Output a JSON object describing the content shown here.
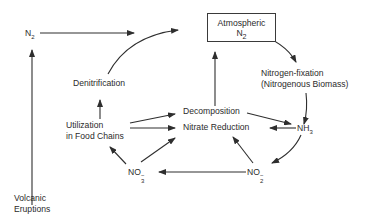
{
  "diagram": {
    "nodes": {
      "n2_source": {
        "label": "N",
        "sub": "2"
      },
      "atmospheric_n2": {
        "line1": "Atmospheric",
        "line2_base": "N",
        "line2_sub": "2"
      },
      "nitrogen_fixation": {
        "line1": "Nitrogen-fixation",
        "line2": "(Nitrogenous Biomass)"
      },
      "denitrification": {
        "label": "Denitrification"
      },
      "decomposition": {
        "label": "Decomposition"
      },
      "nitrate_reduction": {
        "label": "Nitrate Reduction"
      },
      "utilization": {
        "line1": "Utilization",
        "line2": "in Food Chains"
      },
      "nh3": {
        "base": "NH",
        "sub": "3"
      },
      "no3": {
        "base": "NO",
        "charge": "−",
        "sub": "3"
      },
      "no2": {
        "base": "NO",
        "charge": "−",
        "sub": "2"
      },
      "volcanic": {
        "line1": "Volcanic",
        "line2": "Eruptions"
      }
    },
    "edges": [
      {
        "from": "Volcanic Eruptions",
        "to": "N2"
      },
      {
        "from": "N2",
        "to": "Atmospheric N2"
      },
      {
        "from": "Denitrification",
        "to": "Atmospheric N2"
      },
      {
        "from": "Atmospheric N2",
        "to": "Nitrogen-fixation"
      },
      {
        "from": "Nitrogen-fixation",
        "to": "NH3"
      },
      {
        "from": "Decomposition",
        "to": "Atmospheric N2"
      },
      {
        "from": "Decomposition",
        "to": "NH3"
      },
      {
        "from": "NH3",
        "to": "Nitrate Reduction"
      },
      {
        "from": "NH3",
        "to": "NO2-"
      },
      {
        "from": "NO2-",
        "to": "Nitrate Reduction"
      },
      {
        "from": "NO2-",
        "to": "NO3-"
      },
      {
        "from": "NO3-",
        "to": "Nitrate Reduction"
      },
      {
        "from": "NO3-",
        "to": "Utilization in Food Chains"
      },
      {
        "from": "Utilization in Food Chains",
        "to": "Denitrification"
      },
      {
        "from": "Utilization in Food Chains",
        "to": "Decomposition"
      },
      {
        "from": "Utilization in Food Chains",
        "to": "Nitrate Reduction"
      }
    ],
    "colors": {
      "line": "#2e2e2e",
      "text": "#2b2b2b",
      "background": "#ffffff"
    }
  }
}
